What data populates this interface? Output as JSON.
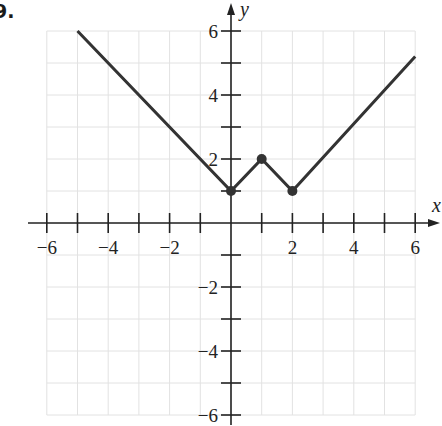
{
  "problem": {
    "number": "9."
  },
  "chart_data": {
    "type": "line",
    "title": "",
    "xlabel": "x",
    "ylabel": "y",
    "xlim": [
      -6,
      6
    ],
    "ylim": [
      -6,
      6
    ],
    "grid": true,
    "x_ticks": [
      -6,
      -5,
      -4,
      -3,
      -2,
      -1,
      1,
      2,
      3,
      4,
      5,
      6
    ],
    "y_ticks": [
      -6,
      -5,
      -4,
      -3,
      -2,
      -1,
      1,
      2,
      3,
      4,
      5,
      6
    ],
    "x_tick_labels": [
      "−6",
      "−4",
      "−2",
      "2",
      "4",
      "6"
    ],
    "x_tick_label_values": [
      -6,
      -4,
      -2,
      2,
      4,
      6
    ],
    "y_tick_labels": [
      "6",
      "4",
      "2",
      "−2",
      "−4",
      "−6"
    ],
    "y_tick_label_values": [
      6,
      4,
      2,
      -2,
      -4,
      -6
    ],
    "series": [
      {
        "name": "f(x)",
        "points": [
          [
            -5,
            6
          ],
          [
            0,
            1
          ],
          [
            1,
            2
          ],
          [
            2,
            1
          ],
          [
            6,
            5.2
          ]
        ],
        "color": "#333333"
      }
    ],
    "marked_points": [
      [
        0,
        1
      ],
      [
        1,
        2
      ],
      [
        2,
        1
      ]
    ]
  },
  "colors": {
    "line": "#333333",
    "grid": "#e2e2e2",
    "axis": "#222222"
  }
}
